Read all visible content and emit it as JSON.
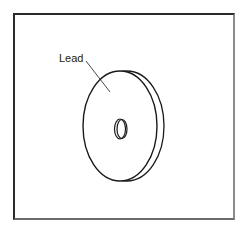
{
  "figure": {
    "label": "Lead",
    "colors": {
      "stroke": "#1a1a1a",
      "background": "#ffffff",
      "frame_dark": "#2a2a2a",
      "frame_light": "#8a8a8a"
    }
  }
}
